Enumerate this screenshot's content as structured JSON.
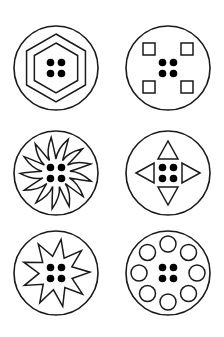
{
  "sheet": {
    "title": "",
    "stroke_color": "#1a1a1a",
    "dot_color": "#000000",
    "background": "#ffffff",
    "grid": {
      "columns": 2,
      "rows": 3
    },
    "buttons": [
      {
        "id": "hexagon",
        "name": "button-hexagon",
        "cx": 56,
        "cy": 68,
        "r": 42,
        "pattern": "nested-hexagons"
      },
      {
        "id": "squares",
        "name": "button-corner-squares",
        "cx": 168,
        "cy": 68,
        "r": 42,
        "pattern": "four-corner-squares"
      },
      {
        "id": "swirl",
        "name": "button-swirl-star",
        "cx": 56,
        "cy": 173,
        "r": 42,
        "pattern": "spiral-spiked-star"
      },
      {
        "id": "arrows",
        "name": "button-arrow-triangles",
        "cx": 168,
        "cy": 173,
        "r": 42,
        "pattern": "four-direction-triangles"
      },
      {
        "id": "starburst",
        "name": "button-starburst",
        "cx": 56,
        "cy": 273,
        "r": 42,
        "pattern": "nine-point-starburst"
      },
      {
        "id": "rings",
        "name": "button-ring-circles",
        "cx": 168,
        "cy": 273,
        "r": 42,
        "pattern": "eight-small-circles"
      }
    ],
    "center_holes": {
      "count": 4,
      "offset": 5.5,
      "radius": 3.8
    }
  }
}
